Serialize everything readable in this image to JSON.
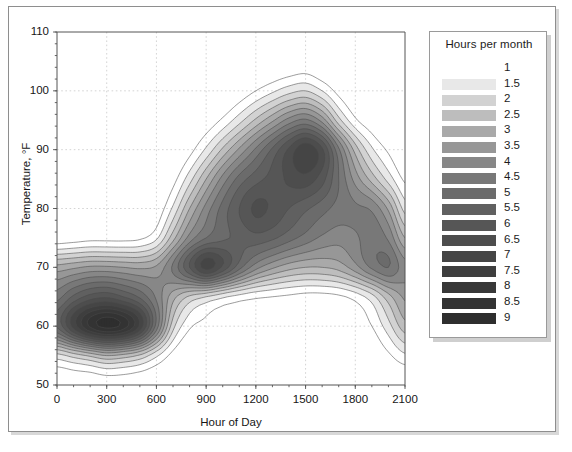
{
  "figure": {
    "background": "#ffffff",
    "frame_color": "#8e8e8e"
  },
  "legend": {
    "title": "Hours per month",
    "entries": [
      {
        "label": "1",
        "color": "#ffffff"
      },
      {
        "label": "1.5",
        "color": "#e8e8e8"
      },
      {
        "label": "2",
        "color": "#d2d2d2"
      },
      {
        "label": "2.5",
        "color": "#bdbdbd"
      },
      {
        "label": "3",
        "color": "#a9a9a9"
      },
      {
        "label": "3.5",
        "color": "#979797"
      },
      {
        "label": "4",
        "color": "#878787"
      },
      {
        "label": "4.5",
        "color": "#787878"
      },
      {
        "label": "5",
        "color": "#6b6b6b"
      },
      {
        "label": "5.5",
        "color": "#606060"
      },
      {
        "label": "6",
        "color": "#565656"
      },
      {
        "label": "6.5",
        "color": "#4d4d4d"
      },
      {
        "label": "7",
        "color": "#454545"
      },
      {
        "label": "7.5",
        "color": "#3e3e3e"
      },
      {
        "label": "8",
        "color": "#383838"
      },
      {
        "label": "8.5",
        "color": "#333333"
      },
      {
        "label": "9",
        "color": "#2e2e2e"
      }
    ]
  },
  "chart_data": {
    "type": "heatmap",
    "title": "",
    "xlabel": "Hour of Day",
    "ylabel": "Temperature, °F",
    "xlim": [
      0,
      2100
    ],
    "ylim": [
      50,
      110
    ],
    "xticks": [
      0,
      300,
      600,
      900,
      1200,
      1500,
      1800,
      2100
    ],
    "yticks": [
      50,
      60,
      70,
      80,
      90,
      100,
      110
    ],
    "grid": true,
    "legend_position": "right",
    "legend_title": "Hours per month",
    "levels": [
      1,
      1.5,
      2,
      2.5,
      3,
      3.5,
      4,
      4.5,
      5,
      5.5,
      6,
      6.5,
      7,
      7.5,
      8,
      8.5,
      9
    ],
    "level_colors": [
      "#ffffff",
      "#e8e8e8",
      "#d2d2d2",
      "#bdbdbd",
      "#a9a9a9",
      "#979797",
      "#878787",
      "#787878",
      "#6b6b6b",
      "#606060",
      "#565656",
      "#4d4d4d",
      "#454545",
      "#3e3e3e",
      "#383838",
      "#333333",
      "#2e2e2e"
    ],
    "annotations": [
      "Dense dark maximum near 300-450 h at 57-62 °F (>9 hours per month)",
      "Local maximum near 900 h at 72 °F",
      "Local maximum near 1500 h at 92 °F",
      "Local maximum near 1250 h at 82 °F",
      "Band rises from 60 °F at 0 h to ~100 °F at 1600 h then falls to ~60 °F at 2100 h"
    ],
    "x": [
      0,
      100,
      200,
      300,
      400,
      500,
      600,
      700,
      800,
      900,
      1000,
      1100,
      1200,
      1300,
      1400,
      1500,
      1600,
      1700,
      1800,
      1900,
      2000,
      2100
    ],
    "y": [
      50,
      55,
      60,
      65,
      70,
      75,
      80,
      85,
      90,
      95,
      100,
      105,
      110
    ],
    "z": [
      [
        0.3,
        0.4,
        0.4,
        0.5,
        0.5,
        0.4,
        0.3,
        0.2,
        0.1,
        0.1,
        0.1,
        0.1,
        0.1,
        0.1,
        0.1,
        0.1,
        0.1,
        0.1,
        0.1,
        0.1,
        0.2,
        0.3
      ],
      [
        1.8,
        2.2,
        2.6,
        3.0,
        2.8,
        2.4,
        1.6,
        0.8,
        0.4,
        0.3,
        0.2,
        0.2,
        0.2,
        0.2,
        0.2,
        0.2,
        0.2,
        0.2,
        0.3,
        0.5,
        0.9,
        1.4
      ],
      [
        5.6,
        7.2,
        8.6,
        9.2,
        8.8,
        7.4,
        4.8,
        2.2,
        1.1,
        0.8,
        0.6,
        0.5,
        0.4,
        0.4,
        0.4,
        0.3,
        0.3,
        0.4,
        0.6,
        1.0,
        1.8,
        2.8
      ],
      [
        4.8,
        5.6,
        6.2,
        6.4,
        6.0,
        5.4,
        4.4,
        3.2,
        2.4,
        2.0,
        1.6,
        1.3,
        1.1,
        1.0,
        0.9,
        0.8,
        0.8,
        0.9,
        1.2,
        1.8,
        2.8,
        3.6
      ],
      [
        3.2,
        3.4,
        3.6,
        3.6,
        3.5,
        3.4,
        3.6,
        4.6,
        6.0,
        7.2,
        6.4,
        5.2,
        4.2,
        3.6,
        3.2,
        3.0,
        3.0,
        3.2,
        3.8,
        4.6,
        5.0,
        4.2
      ],
      [
        0.6,
        0.7,
        0.8,
        0.8,
        0.8,
        0.9,
        1.4,
        2.8,
        4.2,
        5.0,
        5.4,
        5.6,
        5.8,
        5.6,
        5.2,
        4.8,
        4.4,
        4.2,
        4.4,
        4.8,
        4.4,
        3.0
      ],
      [
        0.2,
        0.2,
        0.2,
        0.2,
        0.2,
        0.3,
        0.6,
        1.6,
        3.0,
        4.2,
        5.2,
        6.0,
        6.6,
        6.4,
        6.0,
        5.6,
        5.2,
        4.8,
        4.6,
        4.4,
        3.4,
        1.8
      ],
      [
        0.1,
        0.1,
        0.1,
        0.1,
        0.1,
        0.1,
        0.3,
        0.8,
        1.8,
        3.0,
        4.2,
        5.2,
        5.8,
        6.2,
        6.6,
        6.8,
        6.2,
        5.0,
        3.8,
        2.8,
        1.8,
        0.9
      ],
      [
        0.1,
        0.1,
        0.1,
        0.1,
        0.1,
        0.1,
        0.1,
        0.3,
        0.8,
        1.6,
        2.6,
        3.6,
        4.6,
        5.6,
        6.6,
        7.4,
        6.6,
        4.6,
        2.8,
        1.6,
        0.9,
        0.4
      ],
      [
        0.1,
        0.1,
        0.1,
        0.1,
        0.1,
        0.1,
        0.1,
        0.1,
        0.3,
        0.6,
        1.1,
        1.8,
        2.6,
        3.4,
        4.2,
        4.6,
        3.8,
        2.2,
        1.1,
        0.6,
        0.3,
        0.2
      ],
      [
        0.0,
        0.0,
        0.0,
        0.0,
        0.0,
        0.0,
        0.0,
        0.0,
        0.1,
        0.2,
        0.3,
        0.6,
        1.0,
        1.4,
        1.8,
        2.0,
        1.5,
        0.8,
        0.4,
        0.2,
        0.1,
        0.1
      ],
      [
        0.0,
        0.0,
        0.0,
        0.0,
        0.0,
        0.0,
        0.0,
        0.0,
        0.0,
        0.0,
        0.1,
        0.1,
        0.2,
        0.3,
        0.4,
        0.5,
        0.3,
        0.2,
        0.1,
        0.0,
        0.0,
        0.0
      ],
      [
        0.0,
        0.0,
        0.0,
        0.0,
        0.0,
        0.0,
        0.0,
        0.0,
        0.0,
        0.0,
        0.0,
        0.0,
        0.0,
        0.0,
        0.0,
        0.0,
        0.0,
        0.0,
        0.0,
        0.0,
        0.0,
        0.0
      ]
    ]
  }
}
